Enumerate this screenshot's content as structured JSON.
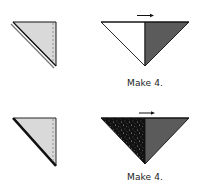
{
  "colors": {
    "light_fill": "#d9d9d9",
    "dark_fill": "#5b5b5b",
    "speckle_fill": "#111111",
    "white_fill": "#ffffff",
    "outline": "#111111"
  },
  "steps": [
    {
      "left_triangle": {
        "pieces": 1,
        "fill": "light",
        "stitch_line": "dashed vertical",
        "hypotenuse": "double line"
      },
      "result": {
        "left_half": "white",
        "right_half": "dark gray",
        "pressing_arrow": "right"
      },
      "caption": "Make 4."
    },
    {
      "left_triangle": {
        "pieces": 1,
        "fill": "light",
        "stitch_line": "dashed vertical",
        "hypotenuse": "thick black line"
      },
      "result": {
        "left_half": "black speckled",
        "right_half": "dark gray",
        "pressing_arrow": "right"
      },
      "caption": "Make 4."
    }
  ]
}
